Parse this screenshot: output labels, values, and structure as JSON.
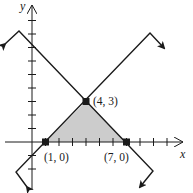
{
  "figure": {
    "type": "linear-inequality-feasible-region",
    "axes": {
      "x_label": "x",
      "y_label": "y"
    },
    "points": [
      {
        "label": "(1, 0)",
        "x": 1,
        "y": 0
      },
      {
        "label": "(4, 3)",
        "x": 4,
        "y": 3
      },
      {
        "label": "(7, 0)",
        "x": 7,
        "y": 0
      }
    ],
    "lines": [
      {
        "name": "line-rising",
        "equation": "y = x - 1"
      },
      {
        "name": "line-falling",
        "equation": "y = -x + 7"
      }
    ],
    "shaded_region": {
      "vertices": [
        [
          1,
          0
        ],
        [
          4,
          3
        ],
        [
          7,
          0
        ]
      ],
      "color": "#cccccc"
    },
    "colors": {
      "stroke": "#1a1a1a",
      "shade": "#cccccc",
      "background": "#ffffff"
    }
  }
}
